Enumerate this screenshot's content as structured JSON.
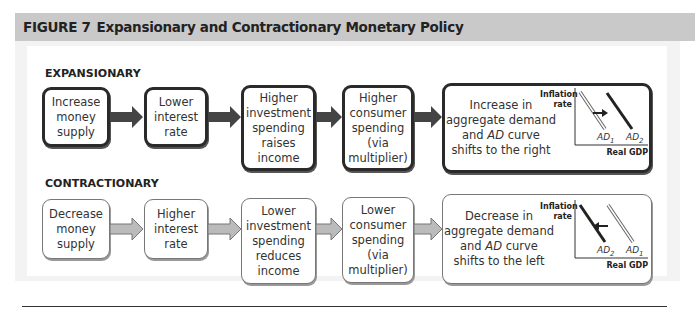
{
  "figure": {
    "label": "FIGURE 7",
    "title": "Expansionary and Contractionary Monetary Policy"
  },
  "expansionary": {
    "heading": "EXPANSIONARY",
    "steps": [
      "Increase money supply",
      "Lower interest rate",
      "Higher investment spending raises income",
      "Higher consumer spending (via multiplier)",
      "Increase in aggregate demand and AD curve shifts to the right"
    ],
    "graph": {
      "ylabel": "Inflation rate",
      "xlabel": "Real GDP",
      "curve_left": "AD1",
      "curve_right": "AD2",
      "shift": "right"
    }
  },
  "contractionary": {
    "heading": "CONTRACTIONARY",
    "steps": [
      "Decrease money supply",
      "Higher interest rate",
      "Lower investment spending reduces income",
      "Lower consumer spending (via multiplier)",
      "Decrease in aggregate demand and AD curve shifts to the left"
    ],
    "graph": {
      "ylabel": "Inflation rate",
      "xlabel": "Real GDP",
      "curve_left": "AD2",
      "curve_right": "AD1",
      "shift": "left"
    }
  },
  "colors": {
    "dark": "#2a2a2a",
    "light": "#777777",
    "header_bg": "#c9c9c9",
    "panel_bg": "#f3f3f3"
  }
}
